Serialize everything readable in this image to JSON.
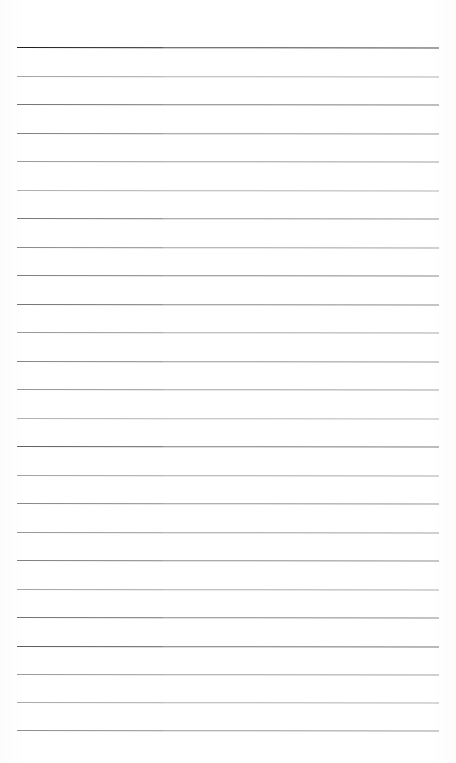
{
  "page": {
    "kind": "scanned-ruled-notepaper",
    "width": 456,
    "height": 763,
    "background_color": "#ffffff",
    "content_text": ""
  },
  "layout": {
    "top_margin_height": 45,
    "bottom_margin_height": 31,
    "left_margin_x": 17,
    "right_margin_x": 439,
    "line_count": 25,
    "line_spacing": 28.5,
    "first_line_y": 47,
    "last_line_y": 730,
    "scan_seam_x": 163
  },
  "colors": {
    "paper": "#ffffff",
    "rule_default": "#7c7c7c",
    "rule_header": "#1e1e1e",
    "rule_light": "#a8a8a8"
  },
  "rules": [
    {
      "index": 1,
      "y": 47,
      "color": "#1f1f1f",
      "thickness": 1.6,
      "opacity": 1.0,
      "slope": 0.6,
      "left_opacity": 1.0,
      "right_opacity": 0.82
    },
    {
      "index": 2,
      "y": 75.5,
      "color": "#8e8e8e",
      "thickness": 1.0,
      "opacity": 0.85,
      "slope": 0.5,
      "left_opacity": 0.8,
      "right_opacity": 0.7
    },
    {
      "index": 3,
      "y": 104,
      "color": "#6e6e6e",
      "thickness": 1.1,
      "opacity": 0.95,
      "slope": 0.6,
      "left_opacity": 0.95,
      "right_opacity": 0.88
    },
    {
      "index": 4,
      "y": 132.5,
      "color": "#777777",
      "thickness": 1.0,
      "opacity": 0.92,
      "slope": 0.5,
      "left_opacity": 0.92,
      "right_opacity": 0.78
    },
    {
      "index": 5,
      "y": 161,
      "color": "#8a8a8a",
      "thickness": 1.0,
      "opacity": 0.86,
      "slope": 0.6,
      "left_opacity": 0.86,
      "right_opacity": 0.8
    },
    {
      "index": 6,
      "y": 189.5,
      "color": "#989898",
      "thickness": 1.0,
      "opacity": 0.8,
      "slope": 0.5,
      "left_opacity": 0.78,
      "right_opacity": 0.74
    },
    {
      "index": 7,
      "y": 218,
      "color": "#717171",
      "thickness": 1.0,
      "opacity": 0.94,
      "slope": 0.6,
      "left_opacity": 0.94,
      "right_opacity": 0.76
    },
    {
      "index": 8,
      "y": 246.5,
      "color": "#7e7e7e",
      "thickness": 1.0,
      "opacity": 0.9,
      "slope": 0.5,
      "left_opacity": 0.9,
      "right_opacity": 0.72
    },
    {
      "index": 9,
      "y": 275,
      "color": "#747474",
      "thickness": 1.0,
      "opacity": 0.93,
      "slope": 0.6,
      "left_opacity": 0.93,
      "right_opacity": 0.84
    },
    {
      "index": 10,
      "y": 303.5,
      "color": "#6f6f6f",
      "thickness": 1.0,
      "opacity": 0.95,
      "slope": 0.5,
      "left_opacity": 0.95,
      "right_opacity": 0.8
    },
    {
      "index": 11,
      "y": 332,
      "color": "#8b8b8b",
      "thickness": 1.0,
      "opacity": 0.84,
      "slope": 0.6,
      "left_opacity": 0.88,
      "right_opacity": 0.74
    },
    {
      "index": 12,
      "y": 360.5,
      "color": "#7a7a7a",
      "thickness": 1.0,
      "opacity": 0.9,
      "slope": 0.5,
      "left_opacity": 0.9,
      "right_opacity": 0.78
    },
    {
      "index": 13,
      "y": 389,
      "color": "#858585",
      "thickness": 1.0,
      "opacity": 0.86,
      "slope": 0.6,
      "left_opacity": 0.86,
      "right_opacity": 0.76
    },
    {
      "index": 14,
      "y": 417.5,
      "color": "#9a9a9a",
      "thickness": 1.0,
      "opacity": 0.78,
      "slope": 0.5,
      "left_opacity": 0.76,
      "right_opacity": 0.72
    },
    {
      "index": 15,
      "y": 446,
      "color": "#5f5f5f",
      "thickness": 1.1,
      "opacity": 0.98,
      "slope": 0.6,
      "left_opacity": 0.98,
      "right_opacity": 0.82
    },
    {
      "index": 16,
      "y": 474.5,
      "color": "#8f8f8f",
      "thickness": 1.0,
      "opacity": 0.82,
      "slope": 0.5,
      "left_opacity": 0.82,
      "right_opacity": 0.76
    },
    {
      "index": 17,
      "y": 503,
      "color": "#7b7b7b",
      "thickness": 1.0,
      "opacity": 0.89,
      "slope": 0.6,
      "left_opacity": 0.89,
      "right_opacity": 0.8
    },
    {
      "index": 18,
      "y": 531.5,
      "color": "#868686",
      "thickness": 1.0,
      "opacity": 0.85,
      "slope": 0.5,
      "left_opacity": 0.85,
      "right_opacity": 0.78
    },
    {
      "index": 19,
      "y": 560,
      "color": "#767676",
      "thickness": 1.0,
      "opacity": 0.91,
      "slope": 0.6,
      "left_opacity": 0.91,
      "right_opacity": 0.82
    },
    {
      "index": 20,
      "y": 588.5,
      "color": "#909090",
      "thickness": 1.0,
      "opacity": 0.82,
      "slope": 0.5,
      "left_opacity": 0.82,
      "right_opacity": 0.75
    },
    {
      "index": 21,
      "y": 617,
      "color": "#6c6c6c",
      "thickness": 1.0,
      "opacity": 0.95,
      "slope": 0.6,
      "left_opacity": 0.95,
      "right_opacity": 0.8
    },
    {
      "index": 22,
      "y": 645.5,
      "color": "#5a5a5a",
      "thickness": 1.1,
      "opacity": 0.98,
      "slope": 0.5,
      "left_opacity": 0.98,
      "right_opacity": 0.84
    },
    {
      "index": 23,
      "y": 674,
      "color": "#888888",
      "thickness": 1.0,
      "opacity": 0.84,
      "slope": 0.6,
      "left_opacity": 0.84,
      "right_opacity": 0.78
    },
    {
      "index": 24,
      "y": 701.5,
      "color": "#949494",
      "thickness": 1.0,
      "opacity": 0.8,
      "slope": 0.5,
      "left_opacity": 0.8,
      "right_opacity": 0.74
    },
    {
      "index": 25,
      "y": 730,
      "color": "#7f7f7f",
      "thickness": 1.0,
      "opacity": 0.88,
      "slope": 0.6,
      "left_opacity": 0.88,
      "right_opacity": 0.78
    }
  ]
}
